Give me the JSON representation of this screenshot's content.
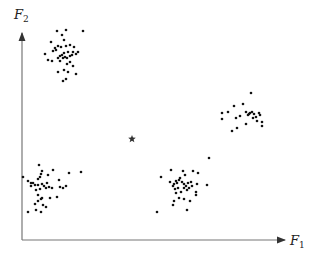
{
  "chart_data": {
    "type": "scatter",
    "title": "",
    "xlabel": "F1",
    "ylabel": "F2",
    "xlabel_main": "F",
    "xlabel_sub": "1",
    "ylabel_main": "F",
    "ylabel_sub": "2",
    "grid": false,
    "ticks": false,
    "legend": null,
    "axis_color": "#777777",
    "point_color": "#111111",
    "pixel_frame": {
      "origin": [
        22,
        240
      ],
      "x_end": 285,
      "y_end": 33
    },
    "series": [
      {
        "name": "cluster-top-left",
        "points": [
          [
            62,
            35
          ],
          [
            57,
            31
          ],
          [
            66,
            30
          ],
          [
            83,
            31
          ],
          [
            51,
            42
          ],
          [
            64,
            40
          ],
          [
            58,
            46
          ],
          [
            55,
            48
          ],
          [
            61,
            47
          ],
          [
            66,
            46
          ],
          [
            70,
            45
          ],
          [
            74,
            47
          ],
          [
            73,
            52
          ],
          [
            68,
            52
          ],
          [
            64,
            53
          ],
          [
            62,
            55
          ],
          [
            60,
            56
          ],
          [
            58,
            58
          ],
          [
            63,
            58
          ],
          [
            65,
            57
          ],
          [
            67,
            58
          ],
          [
            70,
            56
          ],
          [
            72,
            55
          ],
          [
            76,
            54
          ],
          [
            78,
            52
          ],
          [
            45,
            54
          ],
          [
            48,
            60
          ],
          [
            52,
            61
          ],
          [
            60,
            61
          ],
          [
            67,
            64
          ],
          [
            70,
            62
          ],
          [
            73,
            66
          ],
          [
            64,
            70
          ],
          [
            68,
            72
          ],
          [
            76,
            74
          ],
          [
            58,
            72
          ],
          [
            66,
            79
          ],
          [
            63,
            81
          ],
          [
            56,
            50
          ],
          [
            53,
            51
          ]
        ]
      },
      {
        "name": "cluster-bottom-left",
        "points": [
          [
            23,
            177
          ],
          [
            39,
            165
          ],
          [
            42,
            171
          ],
          [
            41,
            174
          ],
          [
            40,
            177
          ],
          [
            38,
            179
          ],
          [
            53,
            170
          ],
          [
            48,
            175
          ],
          [
            47,
            183
          ],
          [
            42,
            184
          ],
          [
            38,
            185
          ],
          [
            35,
            185
          ],
          [
            31,
            186
          ],
          [
            31,
            183
          ],
          [
            33,
            183
          ],
          [
            44,
            186
          ],
          [
            49,
            187
          ],
          [
            52,
            188
          ],
          [
            46,
            188
          ],
          [
            40,
            189
          ],
          [
            36,
            190
          ],
          [
            60,
            187
          ],
          [
            63,
            188
          ],
          [
            66,
            186
          ],
          [
            69,
            173
          ],
          [
            81,
            172
          ],
          [
            38,
            195
          ],
          [
            41,
            199
          ],
          [
            42,
            198
          ],
          [
            38,
            201
          ],
          [
            50,
            198
          ],
          [
            57,
            197
          ],
          [
            35,
            204
          ],
          [
            43,
            205
          ],
          [
            46,
            207
          ],
          [
            36,
            210
          ],
          [
            28,
            212
          ],
          [
            41,
            212
          ],
          [
            59,
            180
          ],
          [
            28,
            181
          ]
        ]
      },
      {
        "name": "cluster-bottom-center",
        "points": [
          [
            171,
            170
          ],
          [
            183,
            171
          ],
          [
            193,
            171
          ],
          [
            198,
            173
          ],
          [
            161,
            177
          ],
          [
            180,
            178
          ],
          [
            176,
            181
          ],
          [
            174,
            184
          ],
          [
            177,
            183
          ],
          [
            179,
            180
          ],
          [
            182,
            182
          ],
          [
            184,
            184
          ],
          [
            186,
            186
          ],
          [
            188,
            183
          ],
          [
            191,
            182
          ],
          [
            173,
            186
          ],
          [
            175,
            189
          ],
          [
            178,
            188
          ],
          [
            184,
            188
          ],
          [
            189,
            188
          ],
          [
            192,
            186
          ],
          [
            197,
            184
          ],
          [
            207,
            185
          ],
          [
            176,
            193
          ],
          [
            181,
            192
          ],
          [
            187,
            190
          ],
          [
            196,
            192
          ],
          [
            196,
            195
          ],
          [
            179,
            198
          ],
          [
            184,
            199
          ],
          [
            190,
            201
          ],
          [
            174,
            201
          ],
          [
            173,
            205
          ],
          [
            187,
            210
          ],
          [
            157,
            212
          ],
          [
            209,
            158
          ],
          [
            185,
            175
          ],
          [
            170,
            182
          ]
        ]
      },
      {
        "name": "cluster-right",
        "points": [
          [
            251,
            93
          ],
          [
            243,
            104
          ],
          [
            234,
            106
          ],
          [
            228,
            112
          ],
          [
            222,
            113
          ],
          [
            246,
            112
          ],
          [
            248,
            115
          ],
          [
            250,
            113
          ],
          [
            252,
            112
          ],
          [
            254,
            114
          ],
          [
            256,
            117
          ],
          [
            253,
            118
          ],
          [
            260,
            115
          ],
          [
            257,
            121
          ],
          [
            262,
            122
          ],
          [
            240,
            116
          ],
          [
            236,
            118
          ],
          [
            246,
            124
          ],
          [
            237,
            128
          ],
          [
            222,
            119
          ],
          [
            262,
            126
          ],
          [
            232,
            131
          ],
          [
            259,
            113
          ],
          [
            249,
            114
          ]
        ]
      },
      {
        "name": "centroid-star",
        "marker": "star",
        "points": [
          [
            132,
            139
          ]
        ]
      }
    ]
  }
}
